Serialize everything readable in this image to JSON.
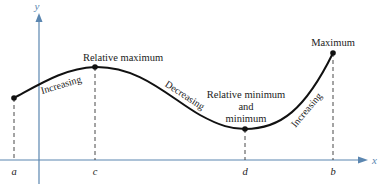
{
  "diagram": {
    "axes": {
      "x_label": "x",
      "y_label": "y",
      "color": "#5b86b0"
    },
    "x_ticks": [
      {
        "label": "a",
        "x": 14
      },
      {
        "label": "c",
        "x": 95
      },
      {
        "label": "d",
        "x": 245
      },
      {
        "label": "b",
        "x": 333
      }
    ],
    "points": {
      "start": {
        "x_label": "a"
      },
      "relative_max": {
        "label": "Relative maximum",
        "x_label": "c"
      },
      "relative_min": {
        "label_line1": "Relative minimum",
        "label_line2": "and",
        "label_line3": "minimum",
        "x_label": "d"
      },
      "maximum": {
        "label": "Maximum",
        "x_label": "b"
      }
    },
    "segments": [
      {
        "label": "Increasing",
        "from": "a",
        "to": "c"
      },
      {
        "label": "Decreasing",
        "from": "c",
        "to": "d"
      },
      {
        "label": "Increasing",
        "from": "d",
        "to": "b"
      }
    ],
    "curve_color": "#111111"
  }
}
